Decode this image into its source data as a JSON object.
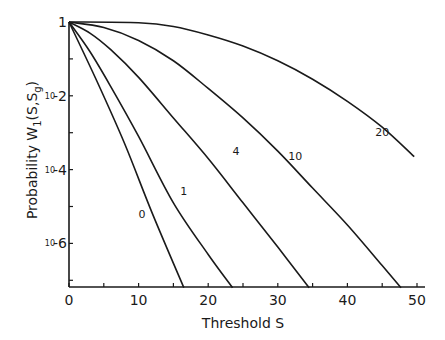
{
  "chart_data": {
    "type": "line",
    "title": "",
    "xlabel": "Threshold S",
    "ylabel": "Probability W1(S,Sg)",
    "ylabel_parts": {
      "main": "Probability  W",
      "sub": "1",
      "args": "(S,S",
      "sub2": "g",
      "close": ")"
    },
    "xlim": [
      0,
      50
    ],
    "ylim_log10": [
      -7.2,
      0
    ],
    "x_ticks": [
      0,
      10,
      20,
      30,
      40,
      50
    ],
    "x_minor_ticks": [
      5,
      15,
      25,
      35,
      45
    ],
    "y_tick_labels": [
      {
        "exp": 0,
        "text": "1",
        "prefix": ""
      },
      {
        "exp": -2,
        "text": "-2",
        "prefix": "10"
      },
      {
        "exp": -4,
        "text": "-4",
        "prefix": "10"
      },
      {
        "exp": -6,
        "text": "-6",
        "prefix": "10"
      }
    ],
    "y_minor_ticks_exp": [
      -1,
      -3,
      -5,
      -7
    ],
    "grid": false,
    "legend": "inline curve labels",
    "series": [
      {
        "name": "0",
        "label_at": [
          10.5,
          -5.3
        ],
        "points": [
          [
            0,
            0
          ],
          [
            4,
            -1.6
          ],
          [
            8,
            -3.3
          ],
          [
            12,
            -5.2
          ],
          [
            16.5,
            -7.2
          ]
        ]
      },
      {
        "name": "1",
        "label_at": [
          16.5,
          -4.7
        ],
        "points": [
          [
            0,
            0
          ],
          [
            3,
            -0.8
          ],
          [
            6,
            -1.75
          ],
          [
            10,
            -3.1
          ],
          [
            15,
            -4.9
          ],
          [
            20,
            -6.3
          ],
          [
            23.5,
            -7.2
          ]
        ]
      },
      {
        "name": "4",
        "label_at": [
          24,
          -3.6
        ],
        "points": [
          [
            0,
            0
          ],
          [
            3,
            -0.3
          ],
          [
            6,
            -0.75
          ],
          [
            10,
            -1.5
          ],
          [
            15,
            -2.6
          ],
          [
            20,
            -3.7
          ],
          [
            25,
            -4.9
          ],
          [
            30,
            -6.1
          ],
          [
            34.5,
            -7.2
          ]
        ]
      },
      {
        "name": "10",
        "label_at": [
          32.5,
          -3.75
        ],
        "points": [
          [
            0,
            0
          ],
          [
            5,
            -0.15
          ],
          [
            10,
            -0.5
          ],
          [
            15,
            -1.05
          ],
          [
            20,
            -1.8
          ],
          [
            25,
            -2.6
          ],
          [
            30,
            -3.5
          ],
          [
            35,
            -4.5
          ],
          [
            40,
            -5.5
          ],
          [
            45,
            -6.6
          ],
          [
            47.7,
            -7.2
          ]
        ]
      },
      {
        "name": "20",
        "label_at": [
          45,
          -3.1
        ],
        "points": [
          [
            0,
            0
          ],
          [
            10,
            -0.02
          ],
          [
            15,
            -0.12
          ],
          [
            20,
            -0.35
          ],
          [
            25,
            -0.65
          ],
          [
            30,
            -1.05
          ],
          [
            35,
            -1.55
          ],
          [
            40,
            -2.15
          ],
          [
            45,
            -2.85
          ],
          [
            49.6,
            -3.65
          ]
        ]
      }
    ]
  }
}
